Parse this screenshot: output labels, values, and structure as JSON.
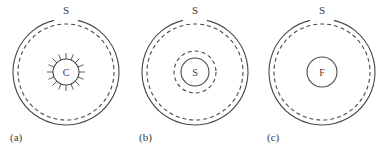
{
  "figure": {
    "background_color": "#ffffff",
    "stroke_color": "#4a4a4a",
    "text_color": "#3a3a3a",
    "panels": [
      {
        "caption": "(a)",
        "caption_x": 10,
        "caption_y": 141,
        "center_x": 66,
        "center_y": 72,
        "outer_radius": 53,
        "dashed_radius": 48,
        "outer_label": "S",
        "outer_label_x": 66,
        "outer_label_y": 14,
        "core": {
          "label": "C",
          "radius": 13,
          "type": "spoked-circle",
          "spoke_count": 16,
          "spoke_length": 6,
          "has_dashed_ring": false
        }
      },
      {
        "caption": "(b)",
        "caption_x": 139,
        "caption_y": 141,
        "center_x": 195,
        "center_y": 72,
        "outer_radius": 53,
        "dashed_radius": 48,
        "outer_label": "S",
        "outer_label_x": 195,
        "outer_label_y": 14,
        "core": {
          "label": "S",
          "radius": 14,
          "type": "circle-with-dashed-ring",
          "spoke_count": 0,
          "spoke_length": 0,
          "has_dashed_ring": true,
          "dashed_ring_radius": 21
        }
      },
      {
        "caption": "(c)",
        "caption_x": 267,
        "caption_y": 141,
        "center_x": 322,
        "center_y": 72,
        "outer_radius": 53,
        "dashed_radius": 48,
        "outer_label": "S",
        "outer_label_x": 322,
        "outer_label_y": 14,
        "core": {
          "label": "F",
          "radius": 15,
          "type": "plain-circle",
          "spoke_count": 0,
          "spoke_length": 0,
          "has_dashed_ring": false
        }
      }
    ]
  }
}
